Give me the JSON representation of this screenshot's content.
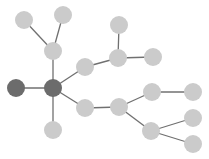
{
  "diagram": {
    "type": "tree-graph",
    "colors": {
      "background": "#ffffff",
      "node_light": "#cbcbcb",
      "node_dark": "#6c6c6c",
      "edge": "#707070"
    },
    "node_radius": 9,
    "nodes": [
      {
        "id": "A",
        "x": 24,
        "y": 20,
        "style": "light"
      },
      {
        "id": "B",
        "x": 63,
        "y": 15,
        "style": "light"
      },
      {
        "id": "C",
        "x": 53,
        "y": 51,
        "style": "light"
      },
      {
        "id": "D",
        "x": 16,
        "y": 88,
        "style": "dark"
      },
      {
        "id": "E",
        "x": 53,
        "y": 88,
        "style": "dark"
      },
      {
        "id": "F",
        "x": 53,
        "y": 130,
        "style": "light"
      },
      {
        "id": "G",
        "x": 85,
        "y": 67,
        "style": "light"
      },
      {
        "id": "H",
        "x": 85,
        "y": 108,
        "style": "light"
      },
      {
        "id": "I",
        "x": 119,
        "y": 25,
        "style": "light"
      },
      {
        "id": "J",
        "x": 118,
        "y": 58,
        "style": "light"
      },
      {
        "id": "K",
        "x": 153,
        "y": 57,
        "style": "light"
      },
      {
        "id": "L",
        "x": 119,
        "y": 107,
        "style": "light"
      },
      {
        "id": "M",
        "x": 152,
        "y": 92,
        "style": "light"
      },
      {
        "id": "N",
        "x": 193,
        "y": 92,
        "style": "light"
      },
      {
        "id": "O",
        "x": 151,
        "y": 131,
        "style": "light"
      },
      {
        "id": "P",
        "x": 193,
        "y": 118,
        "style": "light"
      },
      {
        "id": "Q",
        "x": 193,
        "y": 144,
        "style": "light"
      }
    ],
    "edges": [
      [
        "A",
        "C"
      ],
      [
        "B",
        "C"
      ],
      [
        "C",
        "E"
      ],
      [
        "D",
        "E"
      ],
      [
        "E",
        "F"
      ],
      [
        "E",
        "G"
      ],
      [
        "E",
        "H"
      ],
      [
        "G",
        "J"
      ],
      [
        "I",
        "J"
      ],
      [
        "J",
        "K"
      ],
      [
        "H",
        "L"
      ],
      [
        "L",
        "M"
      ],
      [
        "M",
        "N"
      ],
      [
        "L",
        "O"
      ],
      [
        "O",
        "P"
      ],
      [
        "O",
        "Q"
      ]
    ]
  }
}
